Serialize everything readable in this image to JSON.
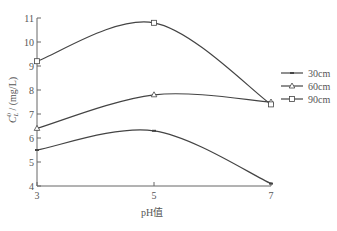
{
  "chart_data": {
    "type": "line",
    "title": "",
    "xlabel": "pH值",
    "ylabel": "C_L^0 / (mg/L)",
    "ylabel_main": "C",
    "ylabel_sub": "L",
    "ylabel_sup": "0",
    "ylabel_unit": " / (mg/L)",
    "x": [
      3,
      5,
      7
    ],
    "xticks": [
      "3",
      "5",
      "7"
    ],
    "xlim": [
      3,
      7
    ],
    "ylim": [
      4,
      11
    ],
    "yticks": [
      "4",
      "5",
      "6",
      "7",
      "8",
      "9",
      "10",
      "11"
    ],
    "grid": false,
    "legend_position": "right",
    "series": [
      {
        "name": "30cm",
        "marker": "dash",
        "values": [
          5.5,
          6.3,
          4.1
        ]
      },
      {
        "name": "60cm",
        "marker": "triangle",
        "values": [
          6.4,
          7.8,
          7.5
        ]
      },
      {
        "name": "90cm",
        "marker": "square",
        "values": [
          9.2,
          10.8,
          7.4
        ]
      }
    ]
  },
  "colors": {
    "line": "#444444",
    "axis": "#666666",
    "text": "#555555"
  }
}
